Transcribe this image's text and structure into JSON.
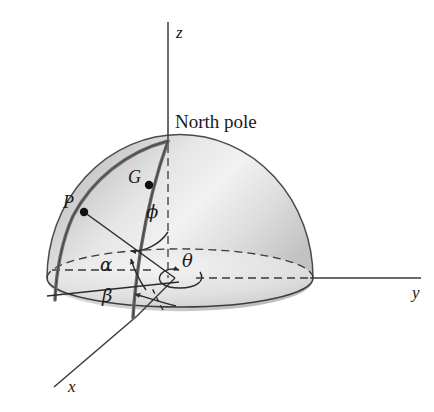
{
  "figure": {
    "name": "spherical-coordinates-hemisphere-diagram",
    "background_color": "#ffffff",
    "line_color": "#3a3a3a",
    "meridian_color": "#5a5a5a",
    "sphere_light": "#f2f2f2",
    "sphere_mid": "#d8d8d8",
    "sphere_dark": "#b4b4b4"
  },
  "axes": [
    {
      "id": "z",
      "label": "z"
    },
    {
      "id": "y",
      "label": "y"
    },
    {
      "id": "x",
      "label": "x"
    }
  ],
  "annotations": {
    "north_pole": "North pole",
    "point_p": "P",
    "point_g": "G"
  },
  "angles": [
    {
      "id": "phi",
      "label": "ϕ"
    },
    {
      "id": "theta",
      "label": "θ"
    },
    {
      "id": "alpha",
      "label": "α"
    },
    {
      "id": "beta",
      "label": "β"
    }
  ]
}
